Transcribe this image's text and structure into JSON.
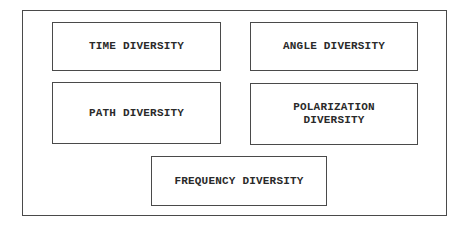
{
  "diagram": {
    "type": "block-diagram",
    "container_label": "",
    "boxes": [
      {
        "id": "time",
        "label": "TIME DIVERSITY"
      },
      {
        "id": "angle",
        "label": "ANGLE DIVERSITY"
      },
      {
        "id": "path",
        "label": "PATH DIVERSITY"
      },
      {
        "id": "polarization",
        "label": "POLARIZATION\nDIVERSITY"
      },
      {
        "id": "frequency",
        "label": "FREQUENCY DIVERSITY"
      }
    ],
    "colors": {
      "border": "#4a4a4a",
      "text": "#2a2a2a",
      "background": "#ffffff"
    }
  }
}
